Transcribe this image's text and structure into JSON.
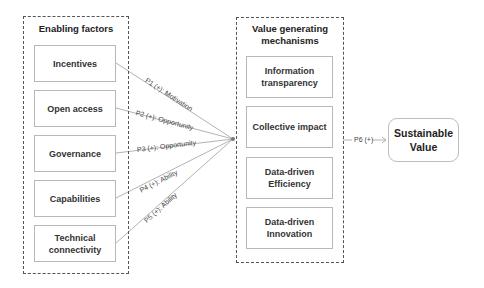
{
  "enabling_factors": {
    "title": "Enabling factors",
    "items": [
      {
        "label": "Incentives"
      },
      {
        "label": "Open access"
      },
      {
        "label": "Governance"
      },
      {
        "label": "Capabilities"
      },
      {
        "label": "Technical connectivity"
      }
    ]
  },
  "value_mechanisms": {
    "title": "Value generating mechanisms",
    "items": [
      {
        "label": "Information transparency"
      },
      {
        "label": "Collective impact"
      },
      {
        "label": "Data-driven Efficiency"
      },
      {
        "label": "Data-driven Innovation"
      }
    ]
  },
  "outcome": {
    "label": "Sustainable Value"
  },
  "propositions": [
    {
      "label": "P1 (+): Motivation"
    },
    {
      "label": "P2 (+): Opportunity"
    },
    {
      "label": "P3 (+): Opportunity"
    },
    {
      "label": "P4 (+): Ability"
    },
    {
      "label": "P5 (+): Ability"
    },
    {
      "label": "P6 (+)"
    }
  ],
  "colors": {
    "border": "#555555",
    "box_border": "#b8b8b8",
    "line": "#9a9a9a",
    "text": "#333333"
  }
}
